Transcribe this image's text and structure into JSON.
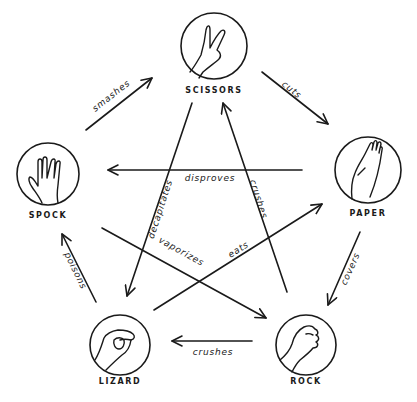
{
  "diagram": {
    "ink_color": "#1a1a1a",
    "background": "#ffffff",
    "nodes": [
      {
        "id": "scissors",
        "label": "SCISSORS",
        "icon": "scissors-hand-icon"
      },
      {
        "id": "paper",
        "label": "PAPER",
        "icon": "paper-hand-icon"
      },
      {
        "id": "rock",
        "label": "ROCK",
        "icon": "rock-fist-icon"
      },
      {
        "id": "lizard",
        "label": "LIZARD",
        "icon": "lizard-hand-icon"
      },
      {
        "id": "spock",
        "label": "SPOCK",
        "icon": "spock-hand-icon"
      }
    ],
    "edges": [
      {
        "from": "scissors",
        "to": "paper",
        "verb": "cuts"
      },
      {
        "from": "paper",
        "to": "rock",
        "verb": "covers"
      },
      {
        "from": "rock",
        "to": "lizard",
        "verb": "crushes"
      },
      {
        "from": "lizard",
        "to": "spock",
        "verb": "poisons"
      },
      {
        "from": "spock",
        "to": "scissors",
        "verb": "smashes"
      },
      {
        "from": "scissors",
        "to": "lizard",
        "verb": "decapitates"
      },
      {
        "from": "lizard",
        "to": "paper",
        "verb": "eats"
      },
      {
        "from": "paper",
        "to": "spock",
        "verb": "disproves"
      },
      {
        "from": "spock",
        "to": "rock",
        "verb": "vaporizes"
      },
      {
        "from": "rock",
        "to": "scissors",
        "verb": "crushes"
      }
    ]
  }
}
